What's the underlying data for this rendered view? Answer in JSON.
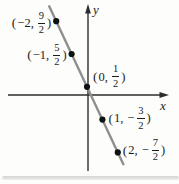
{
  "figure": {
    "background": "#fdfdfc"
  },
  "chart_data": {
    "type": "line",
    "title": "",
    "x_axis_label": "x",
    "y_axis_label": "y",
    "grid": false,
    "legend": false,
    "axis_range_x": [
      -5.1,
      5.3
    ],
    "axis_range_y": [
      -4.6,
      5.4
    ],
    "points": [
      {
        "x": -2,
        "y": 4.5,
        "x_display": "−2",
        "y_sign": "",
        "y_numerator": "9",
        "y_denominator": "2",
        "label_side": "left"
      },
      {
        "x": -1,
        "y": 2.5,
        "x_display": "−1",
        "y_sign": "",
        "y_numerator": "5",
        "y_denominator": "2",
        "label_side": "left"
      },
      {
        "x": 0,
        "y": 0.5,
        "x_display": "0",
        "y_sign": "",
        "y_numerator": "1",
        "y_denominator": "2",
        "label_side": "right"
      },
      {
        "x": 1,
        "y": -1.5,
        "x_display": "1",
        "y_sign": "−",
        "y_numerator": "3",
        "y_denominator": "2",
        "label_side": "right"
      },
      {
        "x": 2,
        "y": -3.5,
        "x_display": "2",
        "y_sign": "−",
        "y_numerator": "7",
        "y_denominator": "2",
        "label_side": "right"
      }
    ],
    "colors": {
      "line": "#8f8f8f",
      "point": "#111111",
      "axis": "#2d2d2d",
      "text": "#1c1c1c",
      "page_edge": "#c6c6c6"
    }
  }
}
